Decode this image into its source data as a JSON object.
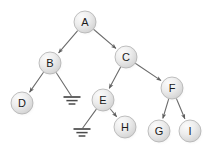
{
  "diagram": {
    "type": "binary-tree",
    "canvas": {
      "width": 210,
      "height": 152,
      "background": "#ffffff"
    },
    "style": {
      "node_fill_light": "#f4f4f4",
      "node_fill_mid": "#e2e2e2",
      "node_fill_dark": "#cfcfcf",
      "node_stroke": "#b0b0b0",
      "node_radius": 11,
      "label_color": "#1a1a1a",
      "edge_color": "#6b6b6b",
      "edge_width": 1.1,
      "ground_color": "#4a4a4a",
      "shadow_color": "#bdbdbd"
    },
    "nodes": [
      {
        "id": "A",
        "label": "A",
        "x": 85,
        "y": 22,
        "level": 0
      },
      {
        "id": "B",
        "label": "B",
        "x": 50,
        "y": 63,
        "level": 1
      },
      {
        "id": "C",
        "label": "C",
        "x": 126,
        "y": 57,
        "level": 1
      },
      {
        "id": "D",
        "label": "D",
        "x": 22,
        "y": 103,
        "level": 2
      },
      {
        "id": "E",
        "label": "E",
        "x": 103,
        "y": 100,
        "level": 2
      },
      {
        "id": "F",
        "label": "F",
        "x": 172,
        "y": 88,
        "level": 2
      },
      {
        "id": "G",
        "label": "G",
        "x": 159,
        "y": 131,
        "level": 3
      },
      {
        "id": "H",
        "label": "H",
        "x": 125,
        "y": 127,
        "level": 3
      },
      {
        "id": "I",
        "label": "I",
        "x": 190,
        "y": 131,
        "level": 3
      }
    ],
    "null_markers": [
      {
        "id": "null-1",
        "label": "null-ground",
        "x": 72,
        "y": 97,
        "width": 17
      },
      {
        "id": "null-2",
        "label": "null-ground",
        "x": 82,
        "y": 129,
        "width": 17
      }
    ],
    "edges": [
      {
        "id": "edge-a-b",
        "from": "A",
        "to": "B",
        "side": "left",
        "arrow": true
      },
      {
        "id": "edge-a-c",
        "from": "A",
        "to": "C",
        "side": "right",
        "arrow": true
      },
      {
        "id": "edge-b-d",
        "from": "B",
        "to": "D",
        "side": "left",
        "arrow": true
      },
      {
        "id": "edge-b-null1",
        "from": "B",
        "to": "null-1",
        "side": "right",
        "arrow": false
      },
      {
        "id": "edge-c-e",
        "from": "C",
        "to": "E",
        "side": "left",
        "arrow": true
      },
      {
        "id": "edge-c-f",
        "from": "C",
        "to": "F",
        "side": "right",
        "arrow": true
      },
      {
        "id": "edge-e-null2",
        "from": "E",
        "to": "null-2",
        "side": "left",
        "arrow": false
      },
      {
        "id": "edge-e-h",
        "from": "E",
        "to": "H",
        "side": "right",
        "arrow": true
      },
      {
        "id": "edge-f-g",
        "from": "F",
        "to": "G",
        "side": "left",
        "arrow": true
      },
      {
        "id": "edge-f-i",
        "from": "F",
        "to": "I",
        "side": "right",
        "arrow": true
      }
    ]
  }
}
